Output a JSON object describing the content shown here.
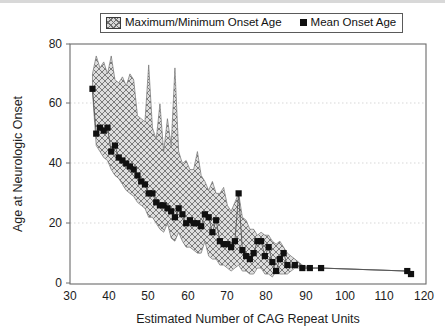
{
  "figure": {
    "background": "#ffffff",
    "frame_color": "#6b6b6b",
    "gridline_color": "#d7d7d7",
    "band_fill": "#d9d9d9",
    "band_hatch": "#6f6f6f",
    "marker_color": "#101010"
  },
  "legend": {
    "items": [
      {
        "label": "Maximum/Minimum Onset Age",
        "swatch": "hatched-band-swatch"
      },
      {
        "label": "Mean Onset Age",
        "swatch": "filled-square-marker"
      }
    ]
  },
  "chart_data": {
    "type": "area",
    "title": "",
    "subtitle": "",
    "xlabel": "Estimated Number of CAG Repeat Units",
    "ylabel": "Age at Neurologic Onset",
    "xlim": [
      30,
      125
    ],
    "ylim": [
      0,
      80
    ],
    "xticks": [
      30,
      40,
      50,
      60,
      70,
      80,
      90,
      100,
      110,
      120
    ],
    "xtick_labels": [
      "30",
      "40",
      "50",
      "60",
      "70",
      "80",
      "90",
      "100",
      "110",
      "120"
    ],
    "yticks": [
      0,
      20,
      40,
      60,
      80
    ],
    "ytick_labels": [
      "0",
      "20",
      "40",
      "60",
      "80"
    ],
    "grid": "horizontal-dotted",
    "legend_position": "above-plot-center",
    "x": [
      36,
      37,
      38,
      39,
      40,
      41,
      42,
      43,
      44,
      45,
      46,
      47,
      48,
      49,
      50,
      51,
      52,
      53,
      54,
      55,
      56,
      57,
      58,
      59,
      60,
      61,
      62,
      63,
      64,
      65,
      66,
      67,
      68,
      69,
      70,
      71,
      72,
      73,
      74,
      75,
      76,
      77,
      78,
      79,
      80,
      81,
      82,
      83,
      84,
      85,
      86,
      87,
      88,
      90,
      92,
      94,
      97,
      120,
      121
    ],
    "series": [
      {
        "name": "Mean Onset Age",
        "type": "scatter-line",
        "values": [
          65,
          50,
          52,
          51,
          52,
          44,
          46,
          42,
          41,
          40,
          39,
          38,
          36,
          34,
          33,
          30,
          30,
          27,
          26,
          26,
          25,
          24,
          22,
          25,
          23,
          20,
          21,
          20,
          20,
          19,
          23,
          22,
          17,
          21,
          14,
          13,
          13,
          12,
          14,
          30,
          11,
          9,
          8,
          10,
          14,
          14,
          9,
          12,
          7,
          4,
          8,
          10,
          6,
          6,
          5,
          5,
          5,
          4,
          3
        ]
      },
      {
        "name": "Maximum Onset Age",
        "type": "band-upper",
        "values": [
          70,
          76,
          72,
          74,
          70,
          76,
          68,
          67,
          69,
          66,
          70,
          68,
          56,
          55,
          54,
          73,
          52,
          48,
          60,
          44,
          55,
          46,
          72,
          44,
          40,
          41,
          38,
          38,
          44,
          36,
          34,
          31,
          34,
          30,
          30,
          32,
          26,
          24,
          27,
          30,
          22,
          21,
          18,
          18,
          16,
          17,
          16,
          16,
          14,
          13,
          14,
          12,
          10,
          8,
          6,
          5,
          5,
          4,
          3
        ]
      },
      {
        "name": "Minimum Onset Age",
        "type": "band-lower",
        "values": [
          64,
          46,
          44,
          42,
          41,
          38,
          36,
          35,
          33,
          31,
          30,
          29,
          27,
          26,
          25,
          22,
          22,
          20,
          18,
          17,
          20,
          15,
          14,
          17,
          14,
          12,
          12,
          11,
          10,
          10,
          14,
          9,
          8,
          8,
          6,
          6,
          5,
          4,
          5,
          6,
          4,
          4,
          3,
          3,
          5,
          5,
          3,
          3,
          2,
          4,
          3,
          3,
          3,
          5,
          5,
          5,
          5,
          4,
          3
        ]
      }
    ],
    "annotations": []
  },
  "axes": {
    "x_title": "Estimated Number of CAG Repeat Units",
    "y_title": "Age at Neurologic Onset"
  }
}
